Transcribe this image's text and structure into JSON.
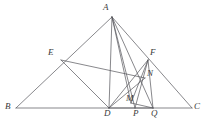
{
  "figure": {
    "type": "geometry-diagram",
    "width": 207,
    "height": 128,
    "stroke_color": "#55555a",
    "background_color": "#ffffff",
    "stroke_width": 0.7
  },
  "points": [
    {
      "id": "A",
      "label": "A",
      "x": 112,
      "y": 17,
      "label_x": 103,
      "label_y": 3
    },
    {
      "id": "B",
      "label": "B",
      "x": 16,
      "y": 108,
      "label_x": 5,
      "label_y": 102
    },
    {
      "id": "C",
      "label": "C",
      "x": 192,
      "y": 108,
      "label_x": 194,
      "label_y": 102
    },
    {
      "id": "E",
      "label": "E",
      "x": 61,
      "y": 60,
      "label_x": 48,
      "label_y": 48
    },
    {
      "id": "F",
      "label": "F",
      "x": 148,
      "y": 60,
      "label_x": 150,
      "label_y": 48
    },
    {
      "id": "N",
      "label": "N",
      "x": 145,
      "y": 78,
      "label_x": 147,
      "label_y": 69
    },
    {
      "id": "D",
      "label": "D",
      "x": 109,
      "y": 108,
      "label_x": 104,
      "label_y": 109
    },
    {
      "id": "M",
      "label": "M",
      "x": 131,
      "y": 103,
      "label_x": 126,
      "label_y": 94
    },
    {
      "id": "P",
      "label": "P",
      "x": 135,
      "y": 108,
      "label_x": 133,
      "label_y": 109
    },
    {
      "id": "Q",
      "label": "Q",
      "x": 153,
      "y": 108,
      "label_x": 151,
      "label_y": 109
    }
  ],
  "segments": [
    {
      "name": "side-AB",
      "from": "A",
      "to": "B"
    },
    {
      "name": "side-AC",
      "from": "A",
      "to": "C"
    },
    {
      "name": "side-BC",
      "from": "B",
      "to": "C"
    },
    {
      "name": "cevian-AD",
      "from": "A",
      "to": "D"
    },
    {
      "name": "cevian-AP",
      "from": "A",
      "to": "P"
    },
    {
      "name": "cevian-AQ",
      "from": "A",
      "to": "Q"
    },
    {
      "name": "cevian-AM",
      "from": "A",
      "to": "M"
    },
    {
      "name": "segment-ED",
      "from": "E",
      "to": "D"
    },
    {
      "name": "segment-EN",
      "from": "E",
      "to": "N"
    },
    {
      "name": "segment-DF",
      "from": "D",
      "to": "F"
    },
    {
      "name": "segment-DN",
      "from": "D",
      "to": "N"
    },
    {
      "name": "segment-DQ",
      "from": "D",
      "to": "Q"
    },
    {
      "name": "segment-FM",
      "from": "F",
      "to": "M"
    },
    {
      "name": "segment-FP",
      "from": "F",
      "to": "P"
    },
    {
      "name": "segment-FQ",
      "from": "F",
      "to": "Q"
    },
    {
      "name": "segment-MQ",
      "from": "M",
      "to": "Q"
    }
  ]
}
